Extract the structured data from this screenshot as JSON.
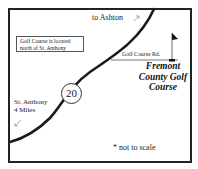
{
  "map": {
    "destination_top": "to Ashton",
    "destination_top_arrow": "north-east",
    "info_box": {
      "line1": "Golf Course is located",
      "line2": "north of St. Anthony"
    },
    "side_road_label": "Golf Course Rd.",
    "course_name": {
      "line1": "Fremont",
      "line2": "County Golf",
      "line3": "Course"
    },
    "destination_bottom": {
      "line1": "St. Anthony",
      "line2": "4 Miles"
    },
    "destination_bottom_arrow": "south-west",
    "route_number": "20",
    "scale_note": "* not to scale",
    "icons": {
      "flag": "golf-flag-icon",
      "route_shield": "highway-shield-icon"
    },
    "colors": {
      "line": "#222222",
      "background": "#ffffff"
    }
  }
}
